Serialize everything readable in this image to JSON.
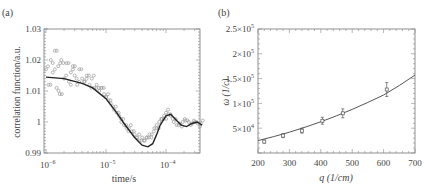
{
  "chart_data": [
    {
      "panel": "(a)",
      "type": "scatter",
      "title": "",
      "xlabel": "time/s",
      "ylabel": "correlation function/a.u.",
      "xscale": "log",
      "xlim": [
        1e-06,
        0.0004
      ],
      "ylim": [
        0.99,
        1.03
      ],
      "xticks": [
        1e-06,
        1e-05,
        0.0001
      ],
      "xtick_labels": [
        "10⁻⁶",
        "10⁻⁵",
        "10⁻⁴"
      ],
      "yticks": [
        0.99,
        1.0,
        1.01,
        1.02,
        1.03
      ],
      "ytick_labels": [
        "0.99",
        "1",
        "1.01",
        "1.02",
        "1.03"
      ],
      "grid": false,
      "legend": null,
      "series": [
        {
          "name": "measured",
          "style": "open circles",
          "x": [
            1e-06,
            1.1e-06,
            1.2e-06,
            1.3e-06,
            1.4e-06,
            1.5e-06,
            1.6e-06,
            1.7e-06,
            1.8e-06,
            2e-06,
            2.2e-06,
            2.4e-06,
            2.6e-06,
            2.8e-06,
            3e-06,
            3.3e-06,
            3.6e-06,
            4e-06,
            4.4e-06,
            4.8e-06,
            5.3e-06,
            5.8e-06,
            6.4e-06,
            7e-06,
            7.7e-06,
            8.5e-06,
            9.3e-06,
            1e-05,
            1.1e-05,
            1.2e-05,
            1.35e-05,
            1.5e-05,
            1.65e-05,
            1.8e-05,
            2e-05,
            2.2e-05,
            2.4e-05,
            2.7e-05,
            3e-05,
            3.3e-05,
            3.6e-05,
            4e-05,
            4.4e-05,
            4.8e-05,
            5.3e-05,
            5.8e-05,
            6.4e-05,
            7e-05,
            7.7e-05,
            8.5e-05,
            9.3e-05,
            0.0001,
            0.00011,
            0.00012,
            0.000135,
            0.00015,
            0.00017,
            0.00019,
            0.00021,
            0.00024,
            0.00027,
            0.0003,
            0.00034,
            0.00038
          ],
          "y": [
            1.017,
            1.012,
            1.02,
            1.016,
            1.023,
            1.011,
            1.018,
            1.009,
            1.02,
            1.014,
            1.019,
            1.013,
            1.016,
            1.018,
            1.015,
            1.012,
            1.017,
            1.014,
            1.013,
            1.015,
            1.012,
            1.014,
            1.011,
            1.012,
            1.01,
            1.011,
            1.009,
            1.008,
            1.007,
            1.006,
            1.004,
            1.003,
            1.002,
            1.0,
            0.999,
            0.998,
            0.998,
            0.997,
            0.996,
            0.995,
            0.994,
            0.995,
            0.994,
            0.995,
            0.996,
            0.996,
            0.998,
            0.999,
            1.0,
            1.001,
            1.002,
            1.003,
            1.0025,
            1.002,
            1.0,
            0.999,
            0.9995,
            1.0,
            1.0005,
            1.0,
            0.9995,
            1.0,
            0.9995,
            0.9995
          ]
        },
        {
          "name": "fit",
          "style": "solid line",
          "x": [
            1e-06,
            2e-06,
            4e-06,
            6e-06,
            1e-05,
            1.5e-05,
            2e-05,
            3e-05,
            4e-05,
            5e-05,
            6e-05,
            7e-05,
            8e-05,
            0.0001,
            0.00012,
            0.00015,
            0.00018,
            0.00022,
            0.00027,
            0.00033,
            0.0004
          ],
          "y": [
            1.0145,
            1.014,
            1.0125,
            1.011,
            1.0075,
            1.003,
            0.9995,
            0.995,
            0.9925,
            0.992,
            0.993,
            0.996,
            0.999,
            1.002,
            1.0025,
            1.0005,
            0.999,
            0.9985,
            0.9995,
            1.0,
            0.999
          ]
        }
      ]
    },
    {
      "panel": "(b)",
      "type": "scatter",
      "title": "",
      "xlabel": "q (1/cm)",
      "ylabel": "ω (1/c)",
      "xlim": [
        200,
        700
      ],
      "ylim": [
        0,
        250000
      ],
      "xticks": [
        200,
        300,
        400,
        500,
        600,
        700
      ],
      "xtick_labels": [
        "200",
        "300",
        "400",
        "500",
        "600",
        "700"
      ],
      "yticks": [
        50000,
        100000,
        150000,
        200000,
        250000
      ],
      "ytick_labels": [
        "5×10⁴",
        "1×10⁵",
        "1.5×10⁵",
        "2×10⁵",
        "2.5×10⁵"
      ],
      "grid": false,
      "legend": null,
      "series": [
        {
          "name": "measured",
          "style": "open markers with error bars",
          "x": [
            220,
            280,
            340,
            405,
            470,
            610
          ],
          "y": [
            23000,
            35000,
            45000,
            65000,
            80000,
            128000
          ],
          "yerr": [
            3000,
            4000,
            5000,
            7000,
            9000,
            14000
          ]
        },
        {
          "name": "fit",
          "style": "solid line",
          "x": [
            200,
            250,
            300,
            350,
            400,
            450,
            500,
            550,
            600,
            650,
            700
          ],
          "y": [
            25000,
            33000,
            42000,
            52000,
            63000,
            75000,
            88000,
            102000,
            117000,
            136000,
            157000
          ]
        }
      ]
    }
  ],
  "panels": {
    "a": {
      "tag": "(a)",
      "xlabel": "time/s",
      "ylabel": "correlation function/a.u.",
      "yticks": [
        "1.03",
        "1.02",
        "1.01",
        "1",
        "0.99"
      ],
      "xtick_base": "10",
      "xtick_exps": [
        "−6",
        "−5",
        "−4"
      ]
    },
    "b": {
      "tag": "(b)",
      "xlabel": "q (1/cm)",
      "ylabel": "ω (1/c)",
      "yticks_mant": [
        "2.5×10",
        "2×10",
        "1.5×10",
        "1×10",
        "5×10"
      ],
      "yticks_exp": [
        "5",
        "5",
        "5",
        "5",
        "4"
      ],
      "xticks": [
        "200",
        "300",
        "400",
        "500",
        "600",
        "700"
      ]
    }
  }
}
